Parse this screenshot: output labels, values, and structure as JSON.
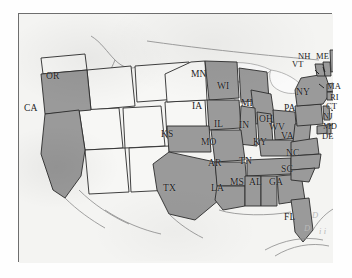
{
  "map": {
    "title": "United States state map with selected states shaded",
    "projection_note": "continental US, Atlantic and Gulf coasts visible",
    "frame": {
      "x": 18,
      "y": 13,
      "width": 314,
      "height": 249
    },
    "colors": {
      "selected_fill": "#9a9a9a",
      "unselected_fill": "#f4f4f2",
      "state_border": "#2b2b2b",
      "coastline": "#7b7b7b",
      "plate_background": "#f2f2f0",
      "frame_border": "#6e6e6e",
      "label_text": "#1b1b1b",
      "faint_text": "#b9b9b9"
    },
    "legend_present": false,
    "selected_states": [
      "OR",
      "CA",
      "MN",
      "WI",
      "IA",
      "MI",
      "IL",
      "IN",
      "OH",
      "PA",
      "NY",
      "VT",
      "NH",
      "ME",
      "MA",
      "RI",
      "CT",
      "NJ",
      "MD",
      "DE",
      "KS",
      "MO",
      "KY",
      "WV",
      "VA",
      "NC",
      "SC",
      "AR",
      "TN",
      "MS",
      "AL",
      "GA",
      "LA",
      "TX",
      "FL"
    ],
    "labels": [
      {
        "id": "OR",
        "text": "OR",
        "x": 45,
        "y": 70,
        "size": "big",
        "leader": false
      },
      {
        "id": "CA",
        "text": "CA",
        "x": 23,
        "y": 102,
        "size": "big",
        "leader": false
      },
      {
        "id": "MN",
        "text": "MN",
        "x": 190,
        "y": 68,
        "size": "big",
        "leader": false
      },
      {
        "id": "WI",
        "text": "WI",
        "x": 216,
        "y": 80,
        "size": "big",
        "leader": false
      },
      {
        "id": "IA",
        "text": "IA",
        "x": 191,
        "y": 100,
        "size": "big",
        "leader": false
      },
      {
        "id": "MI",
        "text": "MI",
        "x": 240,
        "y": 97,
        "size": "big",
        "leader": false
      },
      {
        "id": "IL",
        "text": "IL",
        "x": 213,
        "y": 118,
        "size": "big",
        "leader": false
      },
      {
        "id": "IN",
        "text": "IN",
        "x": 238,
        "y": 119,
        "size": "big",
        "leader": false
      },
      {
        "id": "OH",
        "text": "OH",
        "x": 258,
        "y": 113,
        "size": "big",
        "leader": false
      },
      {
        "id": "KS",
        "text": "KS",
        "x": 160,
        "y": 128,
        "size": "big",
        "leader": false
      },
      {
        "id": "MO",
        "text": "MO",
        "x": 200,
        "y": 136,
        "size": "big",
        "leader": false
      },
      {
        "id": "KY",
        "text": "KY",
        "x": 252,
        "y": 136,
        "size": "big",
        "leader": false
      },
      {
        "id": "TX",
        "text": "TX",
        "x": 162,
        "y": 182,
        "size": "big",
        "leader": false
      },
      {
        "id": "AR",
        "text": "AR",
        "x": 207,
        "y": 157,
        "size": "big",
        "leader": false
      },
      {
        "id": "TN",
        "text": "TN",
        "x": 238,
        "y": 155,
        "size": "big",
        "leader": false
      },
      {
        "id": "LA",
        "text": "LA",
        "x": 210,
        "y": 182,
        "size": "big",
        "leader": false
      },
      {
        "id": "MS",
        "text": "MS",
        "x": 229,
        "y": 176,
        "size": "big",
        "leader": false
      },
      {
        "id": "AL",
        "text": "AL",
        "x": 248,
        "y": 176,
        "size": "big",
        "leader": false
      },
      {
        "id": "GA",
        "text": "GA",
        "x": 268,
        "y": 176,
        "size": "big",
        "leader": false
      },
      {
        "id": "FL",
        "text": "FL",
        "x": 283,
        "y": 211,
        "size": "big",
        "leader": false
      },
      {
        "id": "SC",
        "text": "SC",
        "x": 280,
        "y": 163,
        "size": "big",
        "leader": false
      },
      {
        "id": "NC",
        "text": "NC",
        "x": 285,
        "y": 147,
        "size": "big",
        "leader": false
      },
      {
        "id": "VA",
        "text": "VA",
        "x": 280,
        "y": 130,
        "size": "big",
        "leader": false
      },
      {
        "id": "WV",
        "text": "WV",
        "x": 268,
        "y": 121,
        "size": "big",
        "leader": false
      },
      {
        "id": "PA",
        "text": "PA",
        "x": 283,
        "y": 102,
        "size": "big",
        "leader": false
      },
      {
        "id": "NY",
        "text": "NY",
        "x": 295,
        "y": 86,
        "size": "big",
        "leader": false
      },
      {
        "id": "VT",
        "text": "VT",
        "x": 291,
        "y": 58,
        "size": "sm",
        "leader": true
      },
      {
        "id": "NH",
        "text": "NH",
        "x": 297,
        "y": 50,
        "size": "sm",
        "leader": true
      },
      {
        "id": "ME",
        "text": "ME",
        "x": 315,
        "y": 50,
        "size": "sm",
        "leader": false
      },
      {
        "id": "MA",
        "text": "MA",
        "x": 326,
        "y": 80,
        "size": "sm",
        "leader": true
      },
      {
        "id": "RI",
        "text": "RI",
        "x": 329,
        "y": 91,
        "size": "sm",
        "leader": true
      },
      {
        "id": "CT",
        "text": "CT",
        "x": 325,
        "y": 100,
        "size": "sm",
        "leader": true
      },
      {
        "id": "NJ",
        "text": "NJ",
        "x": 322,
        "y": 110,
        "size": "sm",
        "leader": true
      },
      {
        "id": "MD",
        "text": "MD",
        "x": 322,
        "y": 120,
        "size": "sm",
        "leader": true
      },
      {
        "id": "DE",
        "text": "DE",
        "x": 321,
        "y": 130,
        "size": "sm",
        "leader": true
      }
    ],
    "decorative_marks": [
      {
        "id": "bahamas-mark-1",
        "text": "D",
        "x": 311,
        "y": 209
      },
      {
        "id": "bahamas-mark-2",
        "text": "D",
        "x": 303,
        "y": 222
      },
      {
        "id": "bahamas-mark-3",
        "text": "i i",
        "x": 318,
        "y": 225
      }
    ]
  }
}
